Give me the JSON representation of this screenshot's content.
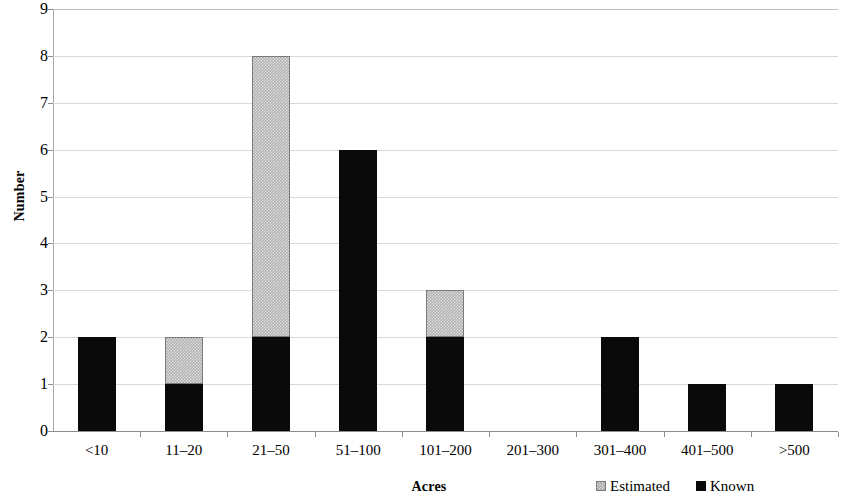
{
  "chart_data": {
    "type": "bar",
    "subtype": "stacked-vertical",
    "title": "",
    "xlabel": "Acres",
    "ylabel": "Number",
    "categories": [
      "<10",
      "11–20",
      "21–50",
      "51–100",
      "101–200",
      "201–300",
      "301–400",
      "401–500",
      ">500"
    ],
    "series": [
      {
        "name": "Known",
        "color": "#0a0a0a",
        "values": [
          2,
          1,
          2,
          6,
          2,
          0,
          2,
          1,
          1
        ]
      },
      {
        "name": "Estimated",
        "color": "#b3b3b3",
        "values": [
          0,
          1,
          6,
          0,
          1,
          0,
          0,
          0,
          0
        ]
      }
    ],
    "totals": [
      2,
      2,
      8,
      6,
      3,
      0,
      2,
      1,
      1
    ],
    "ylim": [
      0,
      9
    ],
    "y_ticks": [
      0,
      1,
      2,
      3,
      4,
      5,
      6,
      7,
      8,
      9
    ],
    "y_tick_labels": [
      "0",
      "1",
      "2",
      "3",
      "4",
      "5",
      "6",
      "7",
      "8",
      "9"
    ],
    "grid": true,
    "grid_axis": "y",
    "legend_position": "bottom-right",
    "legend_entries": [
      "Estimated",
      "Known"
    ],
    "colors": {
      "known": "#0a0a0a",
      "estimated": "#b3b3b3",
      "estimated_border": "#7a7a7a",
      "gridline": "#d9d9d9",
      "axis": "#8c8c8c",
      "background": "#ffffff",
      "text": "#000000"
    }
  }
}
